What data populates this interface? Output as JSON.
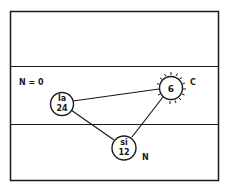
{
  "diagram": {
    "labels": {
      "state": "N = 0",
      "sun_side": "C",
      "lower_node_side": "N"
    },
    "nodes": [
      {
        "id": "la",
        "line1": "la",
        "line2": "24"
      },
      {
        "id": "sun",
        "line1": "6"
      },
      {
        "id": "si",
        "line1": "si",
        "line2": "12"
      }
    ],
    "edges": [
      {
        "from": "la",
        "to": "sun"
      },
      {
        "from": "la",
        "to": "si"
      },
      {
        "from": "si",
        "to": "sun"
      }
    ],
    "colors": {
      "ink": "#1a1a1a",
      "background": "#ffffff"
    }
  }
}
